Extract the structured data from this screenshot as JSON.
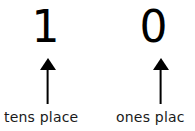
{
  "diagram": {
    "kind": "place-value-diagram",
    "background_color": "#ffffff",
    "ink_color": "#000000",
    "columns": [
      {
        "id": "tens",
        "digit": "1",
        "arrow_icon": "up-arrow-icon",
        "label": "tens place",
        "label_truncated": false
      },
      {
        "id": "ones",
        "digit": "0",
        "arrow_icon": "up-arrow-icon",
        "label": "ones plac",
        "label_truncated": true
      }
    ]
  }
}
